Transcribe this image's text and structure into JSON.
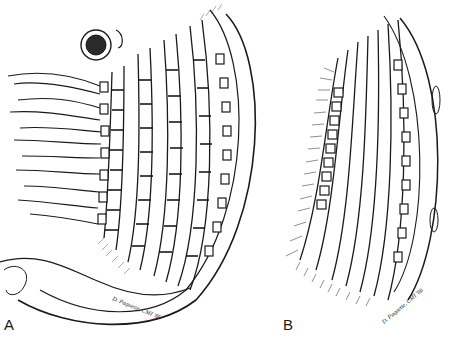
{
  "figure": {
    "panels": [
      {
        "label": "A",
        "signature": "D. Paquette, CMI '86"
      },
      {
        "label": "B",
        "signature": "D. Paquette, CMI '86"
      }
    ],
    "colors": {
      "ink": "#1a1a1a",
      "background": "#ffffff",
      "shade": "#555555"
    }
  }
}
